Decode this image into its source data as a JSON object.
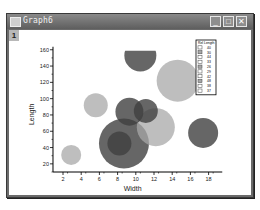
{
  "window": {
    "title": "Graph6",
    "layer_label": "1",
    "buttons": {
      "minimize": "_",
      "maximize": "□",
      "close": "✕"
    }
  },
  "chart_data": {
    "type": "scatter",
    "subtype": "bubble",
    "title": "",
    "xlabel": "Width",
    "ylabel": "Length",
    "xlim": [
      0,
      19
    ],
    "ylim": [
      10,
      160
    ],
    "xticks": [
      2,
      4,
      6,
      8,
      10,
      12,
      14,
      16,
      18
    ],
    "yticks": [
      20,
      40,
      60,
      80,
      100,
      120,
      140,
      160
    ],
    "grid": false,
    "legend_position": "top-right",
    "legend_title": "Rel Length",
    "legend_entries": [
      "40",
      "30",
      "44",
      "33",
      "26",
      "29",
      "42",
      "48",
      "38",
      "37"
    ],
    "points": [
      {
        "x": 2.9,
        "y": 31,
        "size": 10,
        "shade": "light"
      },
      {
        "x": 5.6,
        "y": 92,
        "size": 12,
        "shade": "light"
      },
      {
        "x": 8.7,
        "y": 45,
        "size": 25,
        "shade": "dark"
      },
      {
        "x": 8.2,
        "y": 45,
        "size": 12,
        "shade": "dark"
      },
      {
        "x": 12.2,
        "y": 65,
        "size": 19,
        "shade": "light"
      },
      {
        "x": 9.3,
        "y": 84,
        "size": 14,
        "shade": "dark"
      },
      {
        "x": 11.1,
        "y": 85,
        "size": 12,
        "shade": "dark"
      },
      {
        "x": 10.5,
        "y": 153,
        "size": 16,
        "shade": "dark"
      },
      {
        "x": 14.6,
        "y": 122,
        "size": 21,
        "shade": "light"
      },
      {
        "x": 17.4,
        "y": 58,
        "size": 15,
        "shade": "dark"
      }
    ],
    "colors": {
      "light": "#a8a8a8",
      "dark": "#404040"
    }
  }
}
